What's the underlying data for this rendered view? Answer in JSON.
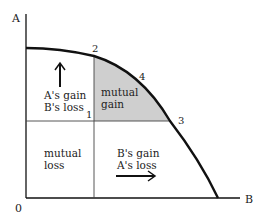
{
  "diagram": {
    "type": "utility-possibility-frontier",
    "axes": {
      "y_label": "A",
      "x_label": "B",
      "origin_label": "0"
    },
    "points": [
      {
        "id": "1",
        "label": "1"
      },
      {
        "id": "2",
        "label": "2"
      },
      {
        "id": "3",
        "label": "3"
      },
      {
        "id": "4",
        "label": "4"
      }
    ],
    "regions": {
      "upper_left": {
        "line1": "A's gain",
        "line2": "B's loss",
        "arrow": "up"
      },
      "upper_right": {
        "line1": "mutual",
        "line2": "gain",
        "shaded": true
      },
      "lower_left": {
        "line1": "mutual",
        "line2": "loss"
      },
      "lower_right": {
        "line1": "B's gain",
        "line2": "A's loss",
        "arrow": "right"
      }
    },
    "colors": {
      "line": "#111111",
      "shade": "#cfcfcf",
      "grid_line": "#444444"
    }
  }
}
